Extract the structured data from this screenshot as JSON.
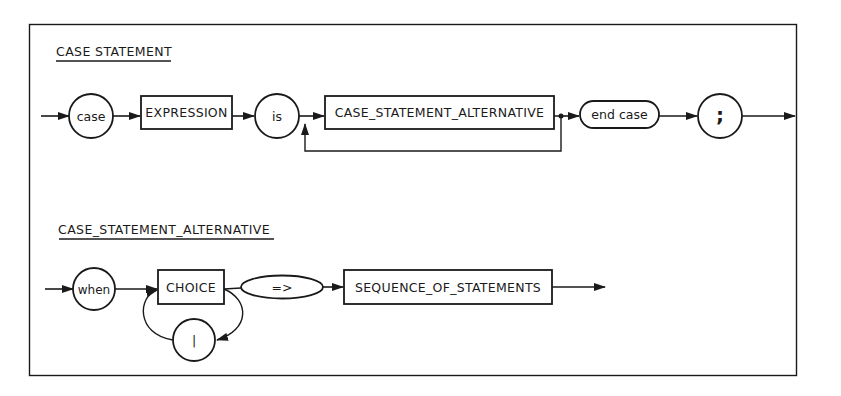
{
  "diagram": {
    "type": "railroad-syntax-diagram",
    "colors": {
      "ink": "#1a1a1a",
      "background": "#ffffff"
    },
    "rules": [
      {
        "title": "CASE STATEMENT",
        "nodes": [
          {
            "kind": "keyword",
            "shape": "circle",
            "label": "case"
          },
          {
            "kind": "nonterminal",
            "shape": "box",
            "label": "EXPRESSION"
          },
          {
            "kind": "keyword",
            "shape": "circle",
            "label": "is"
          },
          {
            "kind": "nonterminal",
            "shape": "box",
            "label": "CASE_STATEMENT_ALTERNATIVE",
            "repeatable": true
          },
          {
            "kind": "keyword",
            "shape": "rounded",
            "label": "end case"
          },
          {
            "kind": "terminal",
            "shape": "circle",
            "label": ";"
          }
        ]
      },
      {
        "title": "CASE_STATEMENT_ALTERNATIVE",
        "nodes": [
          {
            "kind": "keyword",
            "shape": "circle",
            "label": "when"
          },
          {
            "kind": "nonterminal",
            "shape": "box",
            "label": "CHOICE",
            "separator": "|"
          },
          {
            "kind": "terminal",
            "shape": "ellipse",
            "label": "=>"
          },
          {
            "kind": "nonterminal",
            "shape": "box",
            "label": "SEQUENCE_OF_STATEMENTS"
          }
        ],
        "separator": {
          "shape": "circle",
          "label": "|"
        }
      }
    ]
  }
}
